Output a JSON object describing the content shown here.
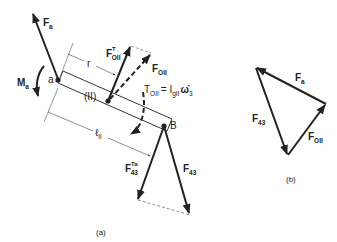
{
  "figure": {
    "part_a": {
      "caption": "(a)",
      "link_label": "(II)",
      "point_a": "a",
      "point_b": "B",
      "dimension_r": "r",
      "dimension_length": {
        "main": "ℓ",
        "sub": "II"
      },
      "moment": {
        "main": "M",
        "sub": "a"
      },
      "force_a": {
        "main": "F",
        "sub": "a"
      },
      "force_oii_t": {
        "main": "F",
        "sub": "OII",
        "sup": "T"
      },
      "force_oii": {
        "main": "F",
        "sub": "OII"
      },
      "torque_eq": {
        "main": "T",
        "sub": "OII",
        "rhs": "= I",
        "rhs_sub": "gII",
        "rhs_tail": "ω̇",
        "rhs_tail_sub": "3"
      },
      "force_43_ta": {
        "main": "F",
        "sub": "43",
        "sup": "Ta"
      },
      "force_43": {
        "main": "F",
        "sub": "43"
      }
    },
    "part_b": {
      "caption": "(b)",
      "force_a": {
        "main": "F",
        "sub": "a"
      },
      "force_43": {
        "main": "F",
        "sub": "43"
      },
      "force_oii": {
        "main": "F",
        "sub": "OII"
      }
    },
    "colors": {
      "ink": "#222222",
      "thin_line": "#444444",
      "background": "#ffffff"
    }
  }
}
